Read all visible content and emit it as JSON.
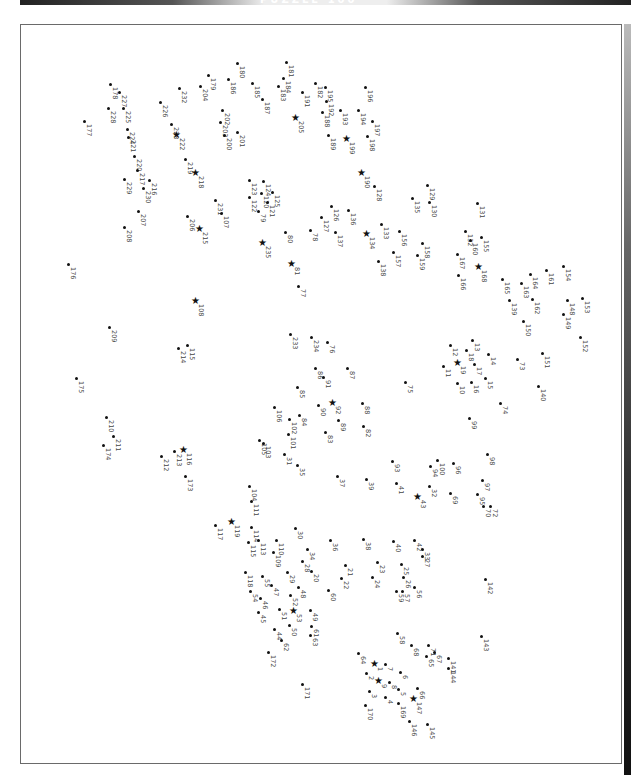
{
  "header": {
    "title": "PUZZLE 100"
  },
  "puzzle": {
    "type": "dot-to-dot",
    "orientation": "rotated-90",
    "star_points": [
      1,
      9,
      19,
      43,
      53,
      81,
      92,
      108,
      116,
      119,
      134,
      147,
      168,
      190,
      199,
      205,
      215,
      218,
      222,
      235
    ],
    "points": [
      {
        "n": 177,
        "x": 84,
        "y": 121
      },
      {
        "n": 178,
        "x": 110,
        "y": 84
      },
      {
        "n": 227,
        "x": 119,
        "y": 92
      },
      {
        "n": 228,
        "x": 108,
        "y": 108
      },
      {
        "n": 225,
        "x": 123,
        "y": 108
      },
      {
        "n": 224,
        "x": 127,
        "y": 129
      },
      {
        "n": 221,
        "x": 128,
        "y": 137
      },
      {
        "n": 220,
        "x": 134,
        "y": 156
      },
      {
        "n": 217,
        "x": 137,
        "y": 170
      },
      {
        "n": 229,
        "x": 124,
        "y": 179
      },
      {
        "n": 216,
        "x": 149,
        "y": 180
      },
      {
        "n": 230,
        "x": 143,
        "y": 188
      },
      {
        "n": 207,
        "x": 138,
        "y": 211
      },
      {
        "n": 208,
        "x": 124,
        "y": 227
      },
      {
        "n": 226,
        "x": 160,
        "y": 102
      },
      {
        "n": 232,
        "x": 179,
        "y": 88
      },
      {
        "n": 223,
        "x": 171,
        "y": 124
      },
      {
        "n": 222,
        "x": 177,
        "y": 135
      },
      {
        "n": 219,
        "x": 185,
        "y": 159
      },
      {
        "n": 218,
        "x": 196,
        "y": 173
      },
      {
        "n": 179,
        "x": 208,
        "y": 75
      },
      {
        "n": 204,
        "x": 200,
        "y": 86
      },
      {
        "n": 180,
        "x": 237,
        "y": 63
      },
      {
        "n": 186,
        "x": 228,
        "y": 79
      },
      {
        "n": 202,
        "x": 222,
        "y": 110
      },
      {
        "n": 203,
        "x": 220,
        "y": 122
      },
      {
        "n": 200,
        "x": 224,
        "y": 135
      },
      {
        "n": 201,
        "x": 237,
        "y": 132
      },
      {
        "n": 185,
        "x": 252,
        "y": 83
      },
      {
        "n": 187,
        "x": 262,
        "y": 99
      },
      {
        "n": 181,
        "x": 286,
        "y": 62
      },
      {
        "n": 184,
        "x": 283,
        "y": 78
      },
      {
        "n": 183,
        "x": 278,
        "y": 86
      },
      {
        "n": 191,
        "x": 302,
        "y": 92
      },
      {
        "n": 205,
        "x": 296,
        "y": 118
      },
      {
        "n": 182,
        "x": 315,
        "y": 83
      },
      {
        "n": 195,
        "x": 325,
        "y": 87
      },
      {
        "n": 192,
        "x": 326,
        "y": 101
      },
      {
        "n": 188,
        "x": 322,
        "y": 112
      },
      {
        "n": 193,
        "x": 340,
        "y": 110
      },
      {
        "n": 189,
        "x": 328,
        "y": 135
      },
      {
        "n": 199,
        "x": 347,
        "y": 139
      },
      {
        "n": 196,
        "x": 365,
        "y": 87
      },
      {
        "n": 194,
        "x": 358,
        "y": 110
      },
      {
        "n": 197,
        "x": 372,
        "y": 121
      },
      {
        "n": 198,
        "x": 367,
        "y": 136
      },
      {
        "n": 231,
        "x": 215,
        "y": 200
      },
      {
        "n": 107,
        "x": 221,
        "y": 213
      },
      {
        "n": 206,
        "x": 187,
        "y": 216
      },
      {
        "n": 215,
        "x": 200,
        "y": 229
      },
      {
        "n": 123,
        "x": 249,
        "y": 180
      },
      {
        "n": 124,
        "x": 263,
        "y": 181
      },
      {
        "n": 122,
        "x": 249,
        "y": 197
      },
      {
        "n": 120,
        "x": 261,
        "y": 193
      },
      {
        "n": 125,
        "x": 272,
        "y": 192
      },
      {
        "n": 121,
        "x": 267,
        "y": 202
      },
      {
        "n": 79,
        "x": 258,
        "y": 211
      },
      {
        "n": 235,
        "x": 263,
        "y": 243
      },
      {
        "n": 80,
        "x": 285,
        "y": 232
      },
      {
        "n": 81,
        "x": 292,
        "y": 264
      },
      {
        "n": 77,
        "x": 298,
        "y": 286
      },
      {
        "n": 190,
        "x": 362,
        "y": 173
      },
      {
        "n": 128,
        "x": 374,
        "y": 186
      },
      {
        "n": 126,
        "x": 331,
        "y": 206
      },
      {
        "n": 127,
        "x": 321,
        "y": 217
      },
      {
        "n": 78,
        "x": 310,
        "y": 230
      },
      {
        "n": 137,
        "x": 335,
        "y": 232
      },
      {
        "n": 136,
        "x": 348,
        "y": 210
      },
      {
        "n": 134,
        "x": 367,
        "y": 234
      },
      {
        "n": 133,
        "x": 381,
        "y": 224
      },
      {
        "n": 135,
        "x": 412,
        "y": 198
      },
      {
        "n": 129,
        "x": 427,
        "y": 185
      },
      {
        "n": 130,
        "x": 429,
        "y": 202
      },
      {
        "n": 156,
        "x": 399,
        "y": 231
      },
      {
        "n": 138,
        "x": 378,
        "y": 261
      },
      {
        "n": 157,
        "x": 393,
        "y": 252
      },
      {
        "n": 158,
        "x": 422,
        "y": 243
      },
      {
        "n": 159,
        "x": 417,
        "y": 255
      },
      {
        "n": 131,
        "x": 477,
        "y": 203
      },
      {
        "n": 132,
        "x": 465,
        "y": 231
      },
      {
        "n": 155,
        "x": 481,
        "y": 237
      },
      {
        "n": 160,
        "x": 470,
        "y": 240
      },
      {
        "n": 167,
        "x": 457,
        "y": 254
      },
      {
        "n": 168,
        "x": 479,
        "y": 267
      },
      {
        "n": 166,
        "x": 458,
        "y": 275
      },
      {
        "n": 165,
        "x": 502,
        "y": 279
      },
      {
        "n": 163,
        "x": 521,
        "y": 283
      },
      {
        "n": 164,
        "x": 530,
        "y": 274
      },
      {
        "n": 161,
        "x": 546,
        "y": 270
      },
      {
        "n": 154,
        "x": 563,
        "y": 266
      },
      {
        "n": 139,
        "x": 509,
        "y": 300
      },
      {
        "n": 162,
        "x": 532,
        "y": 299
      },
      {
        "n": 150,
        "x": 523,
        "y": 321
      },
      {
        "n": 148,
        "x": 567,
        "y": 300
      },
      {
        "n": 153,
        "x": 582,
        "y": 298
      },
      {
        "n": 149,
        "x": 563,
        "y": 314
      },
      {
        "n": 152,
        "x": 580,
        "y": 337
      },
      {
        "n": 176,
        "x": 68,
        "y": 264
      },
      {
        "n": 108,
        "x": 196,
        "y": 301
      },
      {
        "n": 209,
        "x": 109,
        "y": 327
      },
      {
        "n": 214,
        "x": 178,
        "y": 348
      },
      {
        "n": 115,
        "x": 187,
        "y": 345
      },
      {
        "n": 175,
        "x": 76,
        "y": 378
      },
      {
        "n": 233,
        "x": 290,
        "y": 334
      },
      {
        "n": 234,
        "x": 311,
        "y": 337
      },
      {
        "n": 76,
        "x": 327,
        "y": 342
      },
      {
        "n": 86,
        "x": 315,
        "y": 368
      },
      {
        "n": 87,
        "x": 347,
        "y": 368
      },
      {
        "n": 91,
        "x": 323,
        "y": 377
      },
      {
        "n": 85,
        "x": 297,
        "y": 387
      },
      {
        "n": 106,
        "x": 274,
        "y": 407
      },
      {
        "n": 102,
        "x": 289,
        "y": 419
      },
      {
        "n": 84,
        "x": 299,
        "y": 415
      },
      {
        "n": 90,
        "x": 318,
        "y": 405
      },
      {
        "n": 92,
        "x": 333,
        "y": 403
      },
      {
        "n": 88,
        "x": 362,
        "y": 403
      },
      {
        "n": 83,
        "x": 325,
        "y": 432
      },
      {
        "n": 89,
        "x": 338,
        "y": 420
      },
      {
        "n": 82,
        "x": 363,
        "y": 426
      },
      {
        "n": 75,
        "x": 405,
        "y": 382
      },
      {
        "n": 12,
        "x": 450,
        "y": 345
      },
      {
        "n": 13,
        "x": 472,
        "y": 340
      },
      {
        "n": 11,
        "x": 443,
        "y": 366
      },
      {
        "n": 18,
        "x": 466,
        "y": 350
      },
      {
        "n": 19,
        "x": 458,
        "y": 363
      },
      {
        "n": 17,
        "x": 474,
        "y": 364
      },
      {
        "n": 14,
        "x": 488,
        "y": 354
      },
      {
        "n": 73,
        "x": 517,
        "y": 359
      },
      {
        "n": 151,
        "x": 542,
        "y": 353
      },
      {
        "n": 10,
        "x": 457,
        "y": 383
      },
      {
        "n": 16,
        "x": 471,
        "y": 382
      },
      {
        "n": 15,
        "x": 485,
        "y": 378
      },
      {
        "n": 140,
        "x": 538,
        "y": 386
      },
      {
        "n": 74,
        "x": 500,
        "y": 403
      },
      {
        "n": 99,
        "x": 469,
        "y": 418
      },
      {
        "n": 210,
        "x": 106,
        "y": 417
      },
      {
        "n": 211,
        "x": 113,
        "y": 436
      },
      {
        "n": 174,
        "x": 103,
        "y": 445
      },
      {
        "n": 212,
        "x": 161,
        "y": 456
      },
      {
        "n": 213,
        "x": 174,
        "y": 451
      },
      {
        "n": 116,
        "x": 184,
        "y": 450
      },
      {
        "n": 173,
        "x": 185,
        "y": 476
      },
      {
        "n": 105,
        "x": 259,
        "y": 440
      },
      {
        "n": 103,
        "x": 263,
        "y": 443
      },
      {
        "n": 101,
        "x": 288,
        "y": 434
      },
      {
        "n": 31,
        "x": 284,
        "y": 454
      },
      {
        "n": 35,
        "x": 297,
        "y": 465
      },
      {
        "n": 37,
        "x": 337,
        "y": 476
      },
      {
        "n": 93,
        "x": 392,
        "y": 461
      },
      {
        "n": 39,
        "x": 366,
        "y": 479
      },
      {
        "n": 100,
        "x": 437,
        "y": 460
      },
      {
        "n": 94,
        "x": 430,
        "y": 466
      },
      {
        "n": 96,
        "x": 453,
        "y": 463
      },
      {
        "n": 98,
        "x": 487,
        "y": 454
      },
      {
        "n": 41,
        "x": 396,
        "y": 483
      },
      {
        "n": 43,
        "x": 418,
        "y": 497
      },
      {
        "n": 32,
        "x": 429,
        "y": 486
      },
      {
        "n": 69,
        "x": 450,
        "y": 493
      },
      {
        "n": 97,
        "x": 482,
        "y": 480
      },
      {
        "n": 95,
        "x": 477,
        "y": 494
      },
      {
        "n": 70,
        "x": 483,
        "y": 506
      },
      {
        "n": 72,
        "x": 490,
        "y": 506
      },
      {
        "n": 104,
        "x": 249,
        "y": 486
      },
      {
        "n": 111,
        "x": 251,
        "y": 501
      },
      {
        "n": 117,
        "x": 215,
        "y": 525
      },
      {
        "n": 119,
        "x": 232,
        "y": 522
      },
      {
        "n": 114,
        "x": 251,
        "y": 527
      },
      {
        "n": 30,
        "x": 295,
        "y": 528
      },
      {
        "n": 113,
        "x": 258,
        "y": 540
      },
      {
        "n": 110,
        "x": 276,
        "y": 540
      },
      {
        "n": 115,
        "x": 248,
        "y": 542
      },
      {
        "n": 109,
        "x": 273,
        "y": 552
      },
      {
        "n": 34,
        "x": 307,
        "y": 549
      },
      {
        "n": 28,
        "x": 302,
        "y": 561
      },
      {
        "n": 36,
        "x": 330,
        "y": 540
      },
      {
        "n": 38,
        "x": 363,
        "y": 539
      },
      {
        "n": 40,
        "x": 393,
        "y": 541
      },
      {
        "n": 42,
        "x": 414,
        "y": 540
      },
      {
        "n": 33,
        "x": 422,
        "y": 549
      },
      {
        "n": 27,
        "x": 422,
        "y": 556
      },
      {
        "n": 21,
        "x": 345,
        "y": 565
      },
      {
        "n": 23,
        "x": 377,
        "y": 562
      },
      {
        "n": 25,
        "x": 401,
        "y": 564
      },
      {
        "n": 118,
        "x": 245,
        "y": 572
      },
      {
        "n": 55,
        "x": 262,
        "y": 576
      },
      {
        "n": 29,
        "x": 287,
        "y": 572
      },
      {
        "n": 20,
        "x": 311,
        "y": 571
      },
      {
        "n": 22,
        "x": 341,
        "y": 578
      },
      {
        "n": 24,
        "x": 372,
        "y": 577
      },
      {
        "n": 26,
        "x": 403,
        "y": 577
      },
      {
        "n": 142,
        "x": 485,
        "y": 579
      },
      {
        "n": 54,
        "x": 250,
        "y": 591
      },
      {
        "n": 47,
        "x": 271,
        "y": 585
      },
      {
        "n": 48,
        "x": 298,
        "y": 587
      },
      {
        "n": 46,
        "x": 260,
        "y": 598
      },
      {
        "n": 52,
        "x": 290,
        "y": 595
      },
      {
        "n": 60,
        "x": 328,
        "y": 590
      },
      {
        "n": 59,
        "x": 396,
        "y": 591
      },
      {
        "n": 57,
        "x": 402,
        "y": 591
      },
      {
        "n": 56,
        "x": 414,
        "y": 587
      },
      {
        "n": 45,
        "x": 258,
        "y": 612
      },
      {
        "n": 51,
        "x": 279,
        "y": 609
      },
      {
        "n": 53,
        "x": 294,
        "y": 611
      },
      {
        "n": 49,
        "x": 310,
        "y": 610
      },
      {
        "n": 50,
        "x": 289,
        "y": 625
      },
      {
        "n": 61,
        "x": 311,
        "y": 626
      },
      {
        "n": 44,
        "x": 274,
        "y": 629
      },
      {
        "n": 62,
        "x": 281,
        "y": 640
      },
      {
        "n": 63,
        "x": 310,
        "y": 635
      },
      {
        "n": 143,
        "x": 481,
        "y": 636
      },
      {
        "n": 58,
        "x": 397,
        "y": 633
      },
      {
        "n": 172,
        "x": 268,
        "y": 652
      },
      {
        "n": 68,
        "x": 411,
        "y": 645
      },
      {
        "n": 71,
        "x": 428,
        "y": 645
      },
      {
        "n": 64,
        "x": 358,
        "y": 653
      },
      {
        "n": 1,
        "x": 375,
        "y": 664
      },
      {
        "n": 7,
        "x": 385,
        "y": 664
      },
      {
        "n": 65,
        "x": 426,
        "y": 656
      },
      {
        "n": 67,
        "x": 434,
        "y": 652
      },
      {
        "n": 141,
        "x": 448,
        "y": 658
      },
      {
        "n": 6,
        "x": 400,
        "y": 672
      },
      {
        "n": 144,
        "x": 448,
        "y": 668
      },
      {
        "n": 2,
        "x": 366,
        "y": 673
      },
      {
        "n": 9,
        "x": 379,
        "y": 681
      },
      {
        "n": 8,
        "x": 389,
        "y": 682
      },
      {
        "n": 171,
        "x": 302,
        "y": 684
      },
      {
        "n": 5,
        "x": 398,
        "y": 689
      },
      {
        "n": 3,
        "x": 369,
        "y": 691
      },
      {
        "n": 66,
        "x": 417,
        "y": 688
      },
      {
        "n": 4,
        "x": 385,
        "y": 697
      },
      {
        "n": 147,
        "x": 414,
        "y": 699
      },
      {
        "n": 169,
        "x": 398,
        "y": 703
      },
      {
        "n": 170,
        "x": 365,
        "y": 705
      },
      {
        "n": 146,
        "x": 409,
        "y": 721
      },
      {
        "n": 145,
        "x": 427,
        "y": 724
      }
    ]
  }
}
